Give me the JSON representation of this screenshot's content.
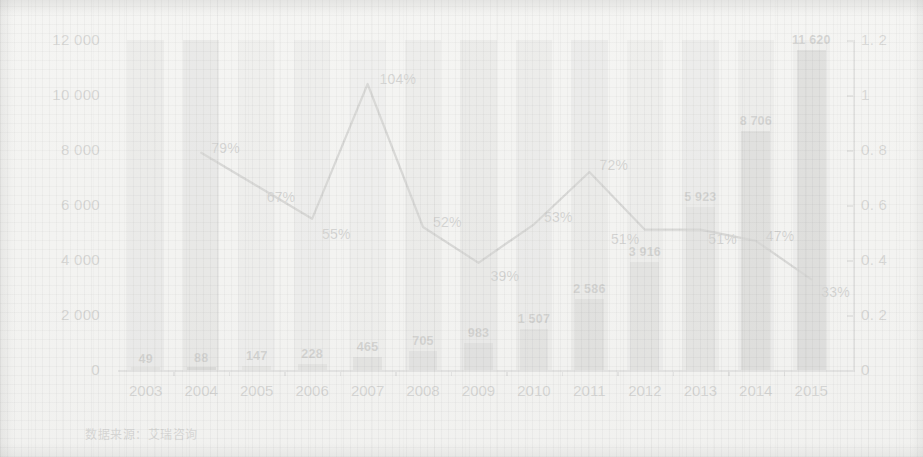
{
  "footnote": "数据来源：艾瑞咨询",
  "colors": {
    "bar": "#8e8e8e",
    "bar_dark": "#6f6f6f",
    "band": "#c3c3c3",
    "line": "#3a3a3a",
    "text": "#222222",
    "paper": "#f3f3f1"
  },
  "chart_data": {
    "type": "bar",
    "title": "",
    "subtitle": "",
    "xlabel": "",
    "ylabel": "",
    "y2label": "",
    "grid": false,
    "legend": "none",
    "categories": [
      "2003",
      "2004",
      "2005",
      "2006",
      "2007",
      "2008",
      "2009",
      "2010",
      "2011",
      "2012",
      "2013",
      "2014",
      "2015"
    ],
    "ylim": [
      0,
      12000
    ],
    "yticks": [
      0,
      2000,
      4000,
      6000,
      8000,
      10000,
      12000
    ],
    "ytick_labels": [
      "0",
      "2 000",
      "4 000",
      "6 000",
      "8 000",
      "10 000",
      "12 000"
    ],
    "y2lim": [
      0,
      1.2
    ],
    "y2ticks": [
      0,
      0.2,
      0.4,
      0.6,
      0.8,
      1.0,
      1.2
    ],
    "y2tick_labels": [
      "0",
      "0. 2",
      "0. 4",
      "0. 6",
      "0. 8",
      "1",
      "1. 2"
    ],
    "series": [
      {
        "name": "规模",
        "type": "bar",
        "axis": "left",
        "values": [
          49,
          88,
          147,
          228,
          465,
          705,
          983,
          1507,
          2586,
          3916,
          5923,
          8706,
          11620
        ],
        "data_labels": [
          "49",
          "88",
          "147",
          "228",
          "465",
          "705",
          "983",
          "1 507",
          "2 586",
          "3 916",
          "5 923",
          "8 706",
          "11 620"
        ]
      },
      {
        "name": "增长率",
        "type": "line",
        "axis": "right",
        "values": [
          null,
          0.79,
          0.67,
          0.55,
          1.04,
          0.52,
          0.39,
          0.53,
          0.72,
          0.51,
          0.51,
          0.47,
          0.33
        ],
        "data_labels": [
          "",
          "79%",
          "67%",
          "55%",
          "104%",
          "52%",
          "39%",
          "53%",
          "72%",
          "51%",
          "51%",
          "47%",
          "33%"
        ]
      }
    ],
    "band_shades": [
      "#bcbcbc",
      "#a9a9a9",
      "#cfcfcf",
      "#cacaca",
      "#d2d2d2",
      "#c0c0c0",
      "#b4b4b4",
      "#bdbdbd",
      "#b8b8b8",
      "#c8c8c8",
      "#bebebe",
      "#c2c2c2",
      "#cacaca"
    ],
    "bar_shades": [
      "#8f8f8f",
      "#4a4a4a",
      "#9b9b9b",
      "#8d8d8d",
      "#8a8a8a",
      "#868686",
      "#7e7e7e",
      "#8a8a8a",
      "#7b7b7b",
      "#8a8a8a",
      "#8e8e8e",
      "#6e6e6e",
      "#6a6a6a"
    ]
  }
}
